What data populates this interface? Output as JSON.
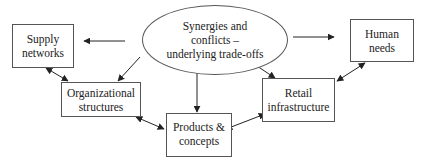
{
  "diagram": {
    "center": {
      "lines": [
        "Synergies and",
        "conflicts –",
        "underlying trade-offs"
      ]
    },
    "nodes": {
      "supply": {
        "lines": [
          "Supply",
          "networks"
        ]
      },
      "human": {
        "lines": [
          "Human",
          "needs"
        ]
      },
      "org": {
        "lines": [
          "Organizational",
          "structures"
        ]
      },
      "products": {
        "lines": [
          "Products &",
          "concepts"
        ]
      },
      "retail": {
        "lines": [
          "Retail",
          "infrastructure"
        ]
      }
    },
    "edges": [
      {
        "from": "center",
        "to": "supply",
        "type": "directed"
      },
      {
        "from": "center",
        "to": "human",
        "type": "directed"
      },
      {
        "from": "center",
        "to": "org",
        "type": "directed"
      },
      {
        "from": "center",
        "to": "products",
        "type": "directed"
      },
      {
        "from": "center",
        "to": "retail",
        "type": "directed"
      },
      {
        "from": "supply",
        "to": "org",
        "type": "bidirectional"
      },
      {
        "from": "org",
        "to": "products",
        "type": "bidirectional"
      },
      {
        "from": "products",
        "to": "retail",
        "type": "bidirectional"
      },
      {
        "from": "retail",
        "to": "human",
        "type": "bidirectional"
      }
    ],
    "colors": {
      "stroke": "#222222",
      "border": "#555555",
      "background": "#ffffff"
    }
  }
}
